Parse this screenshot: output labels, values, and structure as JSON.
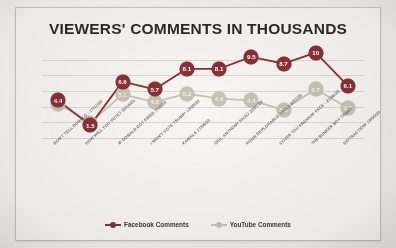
{
  "slide": {
    "title": "VIEWERS' COMMENTS IN THOUSANDS",
    "background_color": "#f7f6f3"
  },
  "legend": {
    "position": "bottom-center",
    "items": [
      {
        "label": "Facebook Comments",
        "color": "#8c2f33"
      },
      {
        "label": "YouTube Comments",
        "color": "#c9c3b4"
      }
    ]
  },
  "chart_data": {
    "type": "line",
    "title": "VIEWERS' COMMENTS IN THOUSANDS",
    "xlabel": "",
    "ylabel": "",
    "ylim": [
      0,
      11
    ],
    "grid": true,
    "legend_position": "bottom-center",
    "categories": [
      "DON'T TELL DONALD - 17/11/20",
      "HOW WILL YOU VOTE? 30/10/20",
      "IF DONALD GOT FIRED 7/10/20",
      "I WON'T VOTE TRUMP! 13/09/20",
      "KAMALA 17/08/20",
      "GEE, ANTHONY FAUCI 22/07/20",
      "POOR DEPLORABLE TROLL 6/07/20",
      "COVER YOU FREAKIN' FACE - 21/06/20",
      "THE BUNKER BOY 7/06/20",
      "DISTRACTION! 19/05/20"
    ],
    "series": [
      {
        "name": "Facebook Comments",
        "color": "#8c2f33",
        "values": [
          4.4,
          1.5,
          6.6,
          5.7,
          8.1,
          8.1,
          9.5,
          8.7,
          10,
          6.1
        ],
        "labels": [
          "4.4",
          "1.5",
          "6.6",
          "5.7",
          "8.1",
          "8.1",
          "9.5",
          "8.7",
          "10",
          "6.1"
        ]
      },
      {
        "name": "YouTube Comments",
        "color": "#c9c3b4",
        "values": [
          4.0,
          1.8,
          5.1,
          4.2,
          5.2,
          4.6,
          4.4,
          3.3,
          5.7,
          3.5
        ],
        "labels": [
          "4.0",
          "1.8",
          "5.1",
          "4.2",
          "5.2",
          "4.6",
          "4.4",
          "3.3",
          "5.7",
          "3.5"
        ]
      }
    ]
  }
}
